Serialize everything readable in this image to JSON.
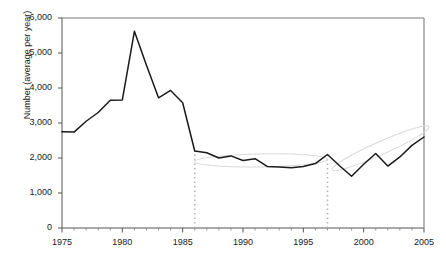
{
  "chart_data": {
    "type": "line",
    "title": "",
    "xlabel": "",
    "ylabel": "Number (average per year)",
    "xlim": [
      1975,
      2005
    ],
    "ylim": [
      0,
      6000
    ],
    "ytick_labels": [
      "0",
      "1,000",
      "2,000",
      "3,000",
      "4,000",
      "5,000",
      "6,000"
    ],
    "ytick_values": [
      0,
      1000,
      2000,
      3000,
      4000,
      5000,
      6000
    ],
    "xtick_labels": [
      "1975",
      "1980",
      "1985",
      "1990",
      "1995",
      "2000",
      "2005"
    ],
    "xtick_values": [
      1975,
      1980,
      1985,
      1990,
      1995,
      2000,
      2005
    ],
    "minor_xtick_interval": 1,
    "grid": false,
    "legend": "none",
    "series": [
      {
        "name": "Number (average per year)",
        "color": "#1a1a1a",
        "x": [
          1975,
          1976,
          1977,
          1978,
          1979,
          1980,
          1981,
          1982,
          1983,
          1984,
          1985,
          1986,
          1987,
          1988,
          1989,
          1990,
          1991,
          1992,
          1993,
          1994,
          1995,
          1996,
          1997,
          1998,
          1999,
          2000,
          2001,
          2002,
          2003,
          2004,
          2005
        ],
        "values": [
          2750,
          2740,
          3050,
          3300,
          3650,
          3660,
          5620,
          4650,
          3720,
          3930,
          3580,
          2200,
          2150,
          2000,
          2060,
          1930,
          1980,
          1760,
          1740,
          1720,
          1760,
          1840,
          2100,
          1780,
          1480,
          1820,
          2130,
          1770,
          2030,
          2360,
          2600
        ]
      }
    ],
    "annotations": [
      {
        "type": "vertical-dotted-line",
        "name": "marker-1986",
        "x": 1986,
        "y_from": 0,
        "y_to": 2200,
        "color": "#b5b5b5"
      },
      {
        "type": "vertical-dotted-line",
        "name": "marker-1997",
        "x": 1997,
        "y_from": 0,
        "y_to": 2100,
        "color": "#b5b5b5"
      },
      {
        "type": "ellipse",
        "name": "flat-trend-ellipse-1986-1997",
        "x_from": 1986,
        "x_to": 1997,
        "y_center": 1930,
        "tilt_deg": -1,
        "color": "#d9d9d9"
      },
      {
        "type": "ellipse",
        "name": "rising-trend-ellipse-1997-2005",
        "x_from": 1997,
        "x_to": 2005.8,
        "y_center": 2280,
        "tilt_deg": -24,
        "color": "#d9d9d9"
      }
    ]
  }
}
